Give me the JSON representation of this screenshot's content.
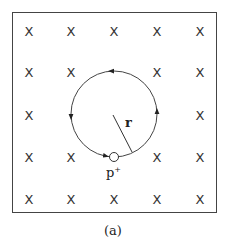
{
  "figure": {
    "caption": "(a)",
    "field_symbol": "X",
    "field_grid": {
      "columns_x": [
        29,
        71,
        114,
        157,
        200
      ],
      "rows_y": [
        31,
        72,
        115,
        157,
        199
      ],
      "omitted": [
        [
          2,
          1
        ],
        [
          1,
          2
        ],
        [
          2,
          2
        ],
        [
          3,
          2
        ],
        [
          2,
          3
        ]
      ]
    },
    "orbit": {
      "center": [
        114,
        114
      ],
      "radius": 43,
      "direction": "counterclockwise"
    },
    "radius_label": "r",
    "particle_label": "p",
    "particle_charge": "+"
  }
}
